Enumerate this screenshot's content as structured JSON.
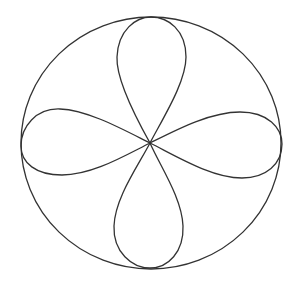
{
  "diagram": {
    "title": "",
    "stroke_color": "#333333",
    "background": "#ffffff",
    "circle": {
      "cx": 151,
      "cy": 143,
      "rx": 130,
      "ry": 126
    },
    "center": {
      "x": 150,
      "y": 143
    },
    "petals": [
      {
        "name": "top",
        "tip": [
          151,
          17
        ]
      },
      {
        "name": "bottom",
        "tip": [
          150,
          268
        ]
      },
      {
        "name": "left",
        "tip": [
          21,
          146
        ]
      },
      {
        "name": "right",
        "tip": [
          282,
          144
        ]
      }
    ]
  }
}
